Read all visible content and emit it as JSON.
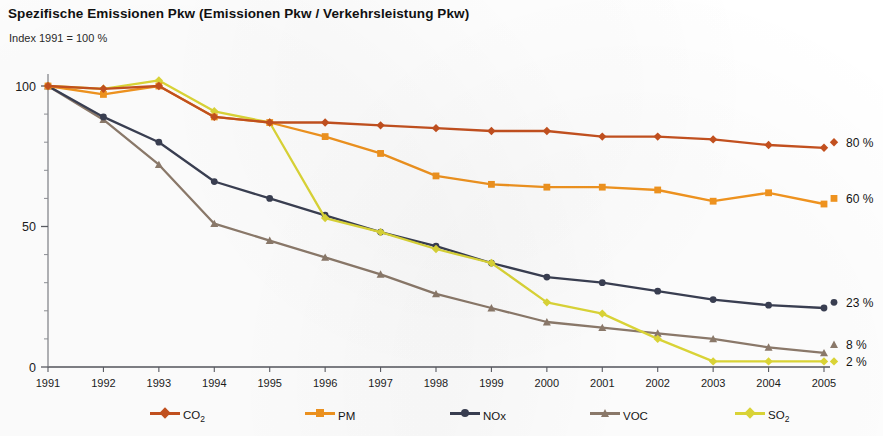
{
  "header": {
    "title": "Spezifische Emissionen Pkw (Emissionen Pkw / Verkehrsleistung Pkw)",
    "subtitle": "Index 1991 = 100 %"
  },
  "legend": {
    "items": [
      {
        "name": "co2",
        "label": "CO",
        "sub": "2",
        "color": "#c4511f",
        "marker": "diamond"
      },
      {
        "name": "pm",
        "label": "PM",
        "sub": "",
        "color": "#f1941f",
        "marker": "square"
      },
      {
        "name": "nox",
        "label": "NOx",
        "sub": "",
        "color": "#3a3f52",
        "marker": "circle"
      },
      {
        "name": "voc",
        "label": "VOC",
        "sub": "",
        "color": "#8c7a6b",
        "marker": "triangle"
      },
      {
        "name": "so2",
        "label": "SO",
        "sub": "2",
        "color": "#dcd637",
        "marker": "diamond"
      }
    ]
  },
  "end_labels": [
    {
      "series": "co2",
      "text": "80 %",
      "value": 80
    },
    {
      "series": "pm",
      "text": "60 %",
      "value": 60
    },
    {
      "series": "nox",
      "text": "23 %",
      "value": 23
    },
    {
      "series": "voc",
      "text": "8 %",
      "value": 8
    },
    {
      "series": "so2",
      "text": "2 %",
      "value": 2
    }
  ],
  "chart_data": {
    "type": "line",
    "title": "Spezifische Emissionen Pkw (Emissionen Pkw / Verkehrsleistung Pkw)",
    "subtitle": "Index 1991 = 100 %",
    "xlabel": "",
    "ylabel": "",
    "xlim": [
      1991,
      2005
    ],
    "ylim": [
      0,
      105
    ],
    "yticks": [
      0,
      50,
      100
    ],
    "ytick_labels": [
      "0",
      "50",
      "100"
    ],
    "minor_yticks": [
      10,
      20,
      30,
      40,
      60,
      70,
      80,
      90
    ],
    "grid": false,
    "legend_position": "bottom",
    "x": [
      1991,
      1992,
      1993,
      1994,
      1995,
      1996,
      1997,
      1998,
      1999,
      2000,
      2001,
      2002,
      2003,
      2004,
      2005
    ],
    "xtick_labels": [
      "1991",
      "1992",
      "1993",
      "1994",
      "1995",
      "1996",
      "1997",
      "1998",
      "1999",
      "2000",
      "2001",
      "2002",
      "2003",
      "2004",
      "2005"
    ],
    "series": [
      {
        "name": "CO2",
        "color": "#c4511f",
        "marker": "diamond",
        "end_label": "80 %",
        "values": [
          100,
          99,
          100,
          89,
          87,
          87,
          86,
          85,
          84,
          84,
          82,
          82,
          81,
          79,
          78
        ]
      },
      {
        "name": "PM",
        "color": "#f1941f",
        "marker": "square",
        "end_label": "60 %",
        "values": [
          100,
          97,
          100,
          89,
          87,
          82,
          76,
          68,
          65,
          64,
          64,
          63,
          59,
          62,
          58
        ]
      },
      {
        "name": "NOx",
        "color": "#3a3f52",
        "marker": "circle",
        "end_label": "23 %",
        "values": [
          100,
          89,
          80,
          66,
          60,
          54,
          48,
          43,
          37,
          32,
          30,
          27,
          24,
          22,
          21
        ]
      },
      {
        "name": "VOC",
        "color": "#8c7a6b",
        "marker": "triangle",
        "end_label": "8 %",
        "values": [
          100,
          88,
          72,
          51,
          45,
          39,
          33,
          26,
          21,
          16,
          14,
          12,
          10,
          7,
          5
        ]
      },
      {
        "name": "SO2",
        "color": "#dcd637",
        "marker": "diamond",
        "end_label": "2 %",
        "values": [
          100,
          99,
          102,
          91,
          87,
          53,
          48,
          42,
          37,
          23,
          19,
          10,
          2,
          2,
          2
        ]
      }
    ]
  },
  "axis_geometry": {
    "left": 48,
    "right": 824,
    "top_value": 105,
    "y_zero_px": 367,
    "y_hundred_px": 86
  }
}
